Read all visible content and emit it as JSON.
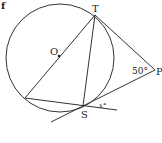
{
  "figure": {
    "marker": "f",
    "points": {
      "T": "T",
      "O": "O",
      "P": "P",
      "S": "S"
    },
    "angles": {
      "at_P": "50°",
      "at_S": "x°"
    },
    "colors": {
      "stroke": "#333333",
      "text": "#222222",
      "background": "#ffffff"
    }
  }
}
